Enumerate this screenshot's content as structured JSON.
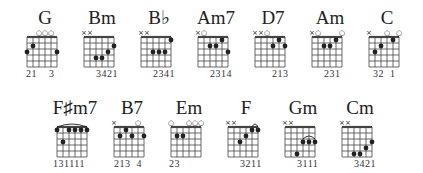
{
  "colors": {
    "ink": "#222222",
    "grid": "#444444",
    "background": "#ffffff"
  },
  "grid": {
    "strings": 6,
    "frets": 5
  },
  "rows": [
    {
      "chords": [
        {
          "name": "G",
          "x": 15,
          "y": 8,
          "top": [
            "",
            "",
            "o",
            "o",
            "o",
            ""
          ],
          "dots": [
            [
              1,
              3
            ],
            [
              2,
              2
            ],
            [
              6,
              3
            ]
          ],
          "barre": null,
          "fingers": "21    3",
          "fingers_offset": 13
        },
        {
          "name": "Bm",
          "x": 72,
          "y": 8,
          "top": [
            "x",
            "x",
            "",
            "",
            "",
            ""
          ],
          "dots": [
            [
              3,
              4
            ],
            [
              4,
              4
            ],
            [
              5,
              3
            ],
            [
              6,
              2
            ]
          ],
          "barre": null,
          "fingers": "3421",
          "fingers_offset": 26
        },
        {
          "name": "B♭",
          "x": 129,
          "y": 8,
          "top": [
            "x",
            "x",
            "",
            "",
            "",
            ""
          ],
          "dots": [
            [
              3,
              3
            ],
            [
              4,
              3
            ],
            [
              5,
              3
            ],
            [
              6,
              1
            ]
          ],
          "barre": null,
          "fingers": "2341",
          "fingers_offset": 26
        },
        {
          "name": "Am7",
          "x": 186,
          "y": 8,
          "top": [
            "x",
            "o",
            "",
            "",
            "",
            ""
          ],
          "dots": [
            [
              3,
              2
            ],
            [
              4,
              2
            ],
            [
              5,
              1
            ],
            [
              6,
              3
            ]
          ],
          "barre": null,
          "fingers": "2314",
          "fingers_offset": 26
        },
        {
          "name": "D7",
          "x": 243,
          "y": 8,
          "top": [
            "x",
            "x",
            "o",
            "",
            "",
            ""
          ],
          "dots": [
            [
              4,
              2
            ],
            [
              5,
              1
            ],
            [
              6,
              2
            ]
          ],
          "barre": null,
          "fingers": "213",
          "fingers_offset": 31
        },
        {
          "name": "Am",
          "x": 300,
          "y": 8,
          "top": [
            "x",
            "o",
            "",
            "",
            "",
            "o"
          ],
          "dots": [
            [
              3,
              2
            ],
            [
              4,
              2
            ],
            [
              5,
              1
            ]
          ],
          "barre": null,
          "fingers": "231",
          "fingers_offset": 26
        },
        {
          "name": "C",
          "x": 357,
          "y": 8,
          "top": [
            "x",
            "",
            "",
            "o",
            "",
            "o"
          ],
          "dots": [
            [
              2,
              3
            ],
            [
              3,
              2
            ],
            [
              5,
              1
            ]
          ],
          "barre": null,
          "fingers": "32  1",
          "fingers_offset": 18
        }
      ]
    },
    {
      "chords": [
        {
          "name": "F♯m7",
          "x": 45,
          "y": 98,
          "top": [
            "",
            "",
            "",
            "",
            "",
            ""
          ],
          "dots": [
            [
              1,
              1
            ],
            [
              2,
              3
            ],
            [
              3,
              1
            ],
            [
              4,
              1
            ],
            [
              5,
              1
            ],
            [
              6,
              1
            ]
          ],
          "barre": [
            1,
            6,
            1
          ],
          "fingers": "131111",
          "fingers_offset": 10
        },
        {
          "name": "B7",
          "x": 102,
          "y": 98,
          "top": [
            "x",
            "",
            "",
            "",
            "o",
            ""
          ],
          "dots": [
            [
              2,
              2
            ],
            [
              3,
              1
            ],
            [
              4,
              2
            ],
            [
              6,
              2
            ]
          ],
          "barre": null,
          "fingers": "213  4",
          "fingers_offset": 14
        },
        {
          "name": "Em",
          "x": 159,
          "y": 98,
          "top": [
            "o",
            "",
            "",
            "o",
            "o",
            "o"
          ],
          "dots": [
            [
              2,
              2
            ],
            [
              3,
              2
            ]
          ],
          "barre": null,
          "fingers": "23",
          "fingers_offset": 12
        },
        {
          "name": "F",
          "x": 216,
          "y": 98,
          "top": [
            "x",
            "x",
            "",
            "",
            "",
            ""
          ],
          "dots": [
            [
              3,
              3
            ],
            [
              4,
              2
            ],
            [
              5,
              1
            ],
            [
              6,
              1
            ]
          ],
          "barre": [
            5,
            6,
            1
          ],
          "fingers": "3211",
          "fingers_offset": 26
        },
        {
          "name": "Gm",
          "x": 273,
          "y": 98,
          "top": [
            "x",
            "x",
            "",
            "",
            "",
            ""
          ],
          "dots": [
            [
              3,
              5
            ],
            [
              4,
              3
            ],
            [
              5,
              3
            ],
            [
              6,
              3
            ]
          ],
          "barre": [
            4,
            6,
            3
          ],
          "fingers": "3111",
          "fingers_offset": 26
        },
        {
          "name": "Cm",
          "x": 330,
          "y": 98,
          "top": [
            "x",
            "x",
            "",
            "",
            "",
            ""
          ],
          "dots": [
            [
              3,
              5
            ],
            [
              4,
              5
            ],
            [
              5,
              4
            ],
            [
              6,
              3
            ]
          ],
          "barre": null,
          "fingers": "3421",
          "fingers_offset": 26
        }
      ]
    }
  ]
}
